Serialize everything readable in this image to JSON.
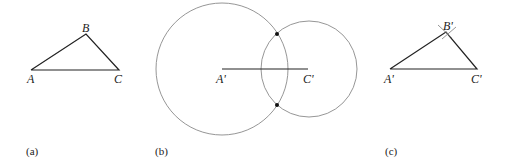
{
  "panels": {
    "a": {
      "caption": "(a)",
      "points": {
        "A": "A",
        "B": "B",
        "C": "C"
      }
    },
    "b": {
      "caption": "(b)",
      "points": {
        "A": "A'",
        "C": "C'"
      }
    },
    "c": {
      "caption": "(c)",
      "points": {
        "A": "A'",
        "B": "B'",
        "C": "C'"
      }
    }
  },
  "colors": {
    "line": "#222222",
    "circle": "#8a8a8a"
  }
}
